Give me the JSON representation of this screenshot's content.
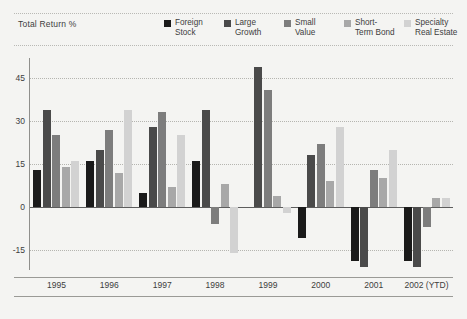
{
  "header": {
    "axis_title": "Total Return %"
  },
  "legend": {
    "position": "top-right",
    "items": [
      {
        "label": "Foreign\nStock",
        "color": "#1a1a1a"
      },
      {
        "label": "Large\nGrowth",
        "color": "#4a4a4a"
      },
      {
        "label": "Small\nValue",
        "color": "#7d7d7d"
      },
      {
        "label": "Short-\nTerm Bond",
        "color": "#a8a8a8"
      },
      {
        "label": "Specialty\nReal Estate",
        "color": "#d2d2d2"
      }
    ]
  },
  "chart_data": {
    "type": "bar",
    "title": "Total Return %",
    "xlabel": "",
    "ylabel": "Total Return %",
    "ylim": [
      -22,
      52
    ],
    "yticks": [
      45,
      30,
      15,
      0,
      -15
    ],
    "grid": true,
    "categories": [
      "1995",
      "1996",
      "1997",
      "1998",
      "1999",
      "2000",
      "2001",
      "2002 (YTD)"
    ],
    "series": [
      {
        "name": "Foreign Stock",
        "color": "#1a1a1a",
        "values": [
          13,
          16,
          5,
          16,
          0,
          -11,
          -19,
          -19
        ]
      },
      {
        "name": "Large Growth",
        "color": "#4a4a4a",
        "values": [
          34,
          20,
          28,
          34,
          49,
          18,
          -21,
          -21
        ]
      },
      {
        "name": "Small Value",
        "color": "#7d7d7d",
        "values": [
          25,
          27,
          33,
          -6,
          41,
          22,
          13,
          -7
        ]
      },
      {
        "name": "Short-Term Bond",
        "color": "#a8a8a8",
        "values": [
          14,
          12,
          7,
          8,
          4,
          9,
          10,
          3
        ]
      },
      {
        "name": "Specialty Real Estate",
        "color": "#d2d2d2",
        "values": [
          16,
          34,
          25,
          -16,
          -2,
          28,
          20,
          3
        ]
      }
    ]
  },
  "axes": {
    "y_ticks": [
      "45",
      "30",
      "15",
      "0",
      "-15"
    ],
    "x_ticks": [
      "1995",
      "1996",
      "1997",
      "1998",
      "1999",
      "2000",
      "2001",
      "2002 (YTD)"
    ]
  }
}
